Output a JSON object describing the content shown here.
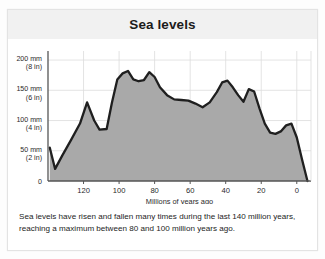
{
  "card": {
    "title": "Sea levels"
  },
  "caption": {
    "line1": "Sea levels have risen and fallen many times during the last 140 million years,",
    "line2": "reaching a maximum between 80 and 100 million years ago."
  },
  "chart_data": {
    "type": "area",
    "title": "Sea levels",
    "xlabel": "Millions of years ago",
    "ylabel": "",
    "xlim": [
      140,
      -8
    ],
    "ylim": [
      0,
      215
    ],
    "x_reversed": true,
    "grid": true,
    "legend": "none",
    "colors": {
      "area_fill": "#a9a9a9",
      "line": "#1f1f1f",
      "grid": "#dcdcdc",
      "axis": "#555555",
      "title_band": "#f1f1f1",
      "text": "#242424"
    },
    "xticks": [
      120,
      100,
      80,
      60,
      40,
      20,
      0
    ],
    "xtick_labels": [
      "120",
      "100",
      "80",
      "60",
      "40",
      "20",
      "0"
    ],
    "yticks": [
      0,
      50,
      100,
      150,
      200
    ],
    "ytick_labels": [
      {
        "mm": "0",
        "in": ""
      },
      {
        "mm": "50 mm",
        "in": "(2 in)"
      },
      {
        "mm": "100 mm",
        "in": "(4 in)"
      },
      {
        "mm": "150 mm",
        "in": "(6 in)"
      },
      {
        "mm": "200 mm",
        "in": "(8 in)"
      }
    ],
    "series": [
      {
        "name": "Sea level",
        "units": "mm",
        "x": [
          139,
          136,
          132,
          127,
          122,
          118,
          114,
          111,
          107,
          104,
          101,
          98,
          95,
          92,
          89,
          86,
          83,
          80,
          77,
          73,
          69,
          65,
          61,
          57,
          53,
          49,
          45,
          42,
          39,
          36,
          33,
          30,
          27,
          24,
          21,
          18,
          15,
          12,
          9,
          6,
          3,
          0,
          -3,
          -6
        ],
        "values": [
          55,
          20,
          42,
          68,
          95,
          130,
          100,
          85,
          86,
          130,
          168,
          178,
          182,
          168,
          165,
          167,
          180,
          172,
          155,
          142,
          135,
          134,
          133,
          128,
          122,
          130,
          147,
          163,
          166,
          155,
          142,
          131,
          152,
          148,
          120,
          95,
          80,
          78,
          82,
          92,
          95,
          72,
          35,
          0
        ]
      }
    ]
  }
}
